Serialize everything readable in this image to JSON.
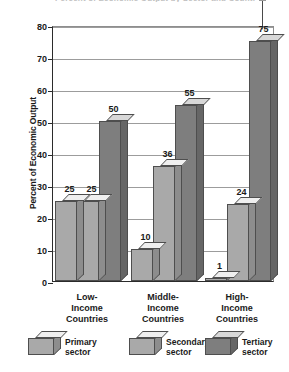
{
  "chart_data": {
    "type": "bar",
    "title": "Percent of Economic Output by Sector and Country Income Level",
    "xlabel": "",
    "ylabel": "Percent of Economic Output",
    "ylim": [
      0,
      80
    ],
    "ytick_step": 10,
    "grid": true,
    "legend_position": "bottom",
    "categories": [
      "Low-Income Countries",
      "Middle-Income Countries",
      "High-Income Countries"
    ],
    "series": [
      {
        "name": "Primary sector",
        "values": [
          25,
          10,
          1
        ],
        "color": "#a9a9a9"
      },
      {
        "name": "Secondary sector",
        "values": [
          25,
          36,
          24
        ],
        "color": "#a9a9a9"
      },
      {
        "name": "Tertiary sector",
        "values": [
          50,
          55,
          75
        ],
        "color": "#7e7e7e"
      }
    ],
    "yticks": [
      {
        "value": 80,
        "label": "80"
      },
      {
        "value": 70,
        "label": "70"
      },
      {
        "value": 60,
        "label": "60"
      },
      {
        "value": 50,
        "label": "50"
      },
      {
        "value": 40,
        "label": "40"
      },
      {
        "value": 30,
        "label": "30"
      },
      {
        "value": 20,
        "label": "20"
      },
      {
        "value": 10,
        "label": "10"
      },
      {
        "value": 0,
        "label": "0"
      }
    ],
    "category_label_lines": [
      [
        "Low-",
        "Income",
        "Countries"
      ],
      [
        "Middle-",
        "Income",
        "Countries"
      ],
      [
        "High-",
        "Income",
        "Countries"
      ]
    ],
    "annotation": {
      "type": "arrow",
      "target_value": 75,
      "target_series": "Tertiary sector",
      "target_category": "High-Income Countries"
    }
  },
  "colors": {
    "bar_light": "#a9a9a9",
    "bar_light_top": "#efefef",
    "bar_light_side": "#8d8d8d",
    "bar_dark": "#7e7e7e",
    "bar_dark_top": "#d8d8d8",
    "bar_dark_side": "#666666",
    "outline": "#4e4e4e",
    "axis": "#2b2b2b",
    "gridline": "#9c9c9c",
    "text": "#1a1a1a",
    "background": "#ffffff"
  }
}
